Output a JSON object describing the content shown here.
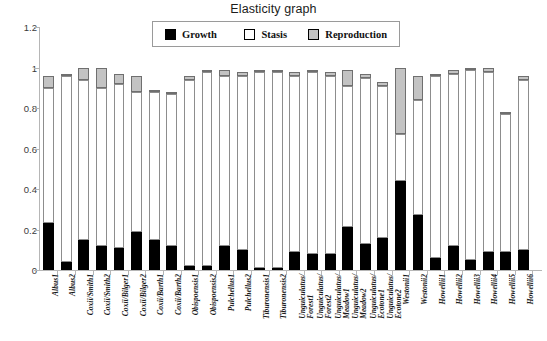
{
  "chart_data": {
    "type": "bar",
    "subtype": "stacked-bar",
    "title": "Elasticity graph",
    "xlabel": "",
    "ylabel": "",
    "ylim": [
      0,
      1.2
    ],
    "yticks": [
      0,
      0.2,
      0.4,
      0.6,
      0.8,
      1,
      1.2
    ],
    "ytick_labels": [
      "0",
      "0.2",
      "0.4",
      "0.6",
      "0.8",
      "1",
      "1.2"
    ],
    "grid": false,
    "legend_position": "top-center",
    "legend": [
      "Growth",
      "Stasis",
      "Reproduction"
    ],
    "colors": {
      "growth": "#000000",
      "stasis": "#ffffff",
      "reproduction": "#c3c3c3",
      "axis": "#b6b6b6",
      "text": "#1a1a1a"
    },
    "categories": [
      "Albus1",
      "Albus2",
      "Coxii/Smith1",
      "Coxii/Smith2",
      "Coxii/Bilger1",
      "Coxii/Bilger2",
      "Coxii/Barth1",
      "Coxii/Barth2",
      "Obispoensis1",
      "Obispoensis2",
      "Pulchellus1",
      "Pulchellus2",
      "Tiburonensis1",
      "Tiburonensis2",
      "Unguiculatus/Forest1",
      "Unguiculatus/Forest2",
      "Unguiculatus/Meadow1",
      "Unguiculatus/Meadow2",
      "Unguiculatus/Ecotone1",
      "Unguiculatus/Ecotone2",
      "Westonii1",
      "Westonii2",
      "Howellii1",
      "Howellii2",
      "Howellii3",
      "Howellii4",
      "Howellii5",
      "Howellii6"
    ],
    "category_lines": [
      [
        "Albus1"
      ],
      [
        "Albus2"
      ],
      [
        "Coxii/Smith1"
      ],
      [
        "Coxii/Smith2"
      ],
      [
        "Coxii/Bilger1"
      ],
      [
        "Coxii/Bilger2"
      ],
      [
        "Coxii/Barth1"
      ],
      [
        "Coxii/Barth2"
      ],
      [
        "Obispoensis1"
      ],
      [
        "Obispoensis2"
      ],
      [
        "Pulchellus1"
      ],
      [
        "Pulchellus2"
      ],
      [
        "Tiburonensis1"
      ],
      [
        "Tiburonensis2"
      ],
      [
        "Unguiculatus/",
        "Forest1"
      ],
      [
        "Unguiculatus/",
        "Forest2"
      ],
      [
        "Unguiculatus/",
        "Meadow1"
      ],
      [
        "Unguiculatus/",
        "Meadow2"
      ],
      [
        "Unguiculatus/",
        "Ecotone1"
      ],
      [
        "Unguiculatus/",
        "Ecotone2"
      ],
      [
        "Westonii1"
      ],
      [
        "Westonii2"
      ],
      [
        "Howellii1"
      ],
      [
        "Howellii2"
      ],
      [
        "Howellii3"
      ],
      [
        "Howellii4"
      ],
      [
        "Howellii5"
      ],
      [
        "Howellii6"
      ]
    ],
    "series": [
      {
        "name": "Growth",
        "values": [
          0.23,
          0.04,
          0.15,
          0.12,
          0.11,
          0.19,
          0.15,
          0.12,
          0.02,
          0.02,
          0.12,
          0.1,
          0.01,
          0.01,
          0.09,
          0.08,
          0.08,
          0.21,
          0.13,
          0.16,
          0.44,
          0.27,
          0.06,
          0.12,
          0.05,
          0.09,
          0.09,
          0.1
        ]
      },
      {
        "name": "Stasis",
        "values": [
          0.67,
          0.92,
          0.79,
          0.78,
          0.81,
          0.69,
          0.73,
          0.75,
          0.92,
          0.96,
          0.84,
          0.86,
          0.97,
          0.97,
          0.87,
          0.9,
          0.88,
          0.7,
          0.82,
          0.75,
          0.23,
          0.57,
          0.9,
          0.85,
          0.94,
          0.89,
          0.68,
          0.84
        ]
      },
      {
        "name": "Reproduction",
        "values": [
          0.06,
          0.01,
          0.06,
          0.1,
          0.05,
          0.08,
          0.01,
          0.01,
          0.02,
          0.01,
          0.03,
          0.02,
          0.01,
          0.01,
          0.02,
          0.01,
          0.02,
          0.08,
          0.02,
          0.02,
          0.33,
          0.12,
          0.01,
          0.02,
          0.01,
          0.02,
          0.01,
          0.02
        ]
      }
    ],
    "totals": [
      0.96,
      0.97,
      1.0,
      1.0,
      0.97,
      0.96,
      0.89,
      0.88,
      0.96,
      0.99,
      0.99,
      0.98,
      0.99,
      0.99,
      0.98,
      0.99,
      0.98,
      0.99,
      0.97,
      0.93,
      1.0,
      0.96,
      0.97,
      0.99,
      1.0,
      1.0,
      0.78,
      0.96
    ]
  },
  "legend_swatch_names": [
    "growth-swatch",
    "stasis-swatch",
    "reproduction-swatch"
  ]
}
